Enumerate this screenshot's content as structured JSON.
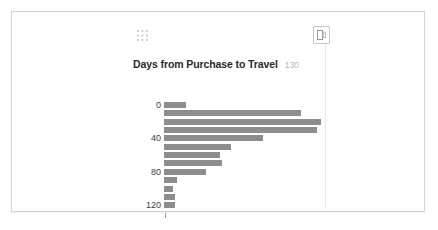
{
  "card": {
    "name": "dashboard-card"
  },
  "toolbar": {
    "drag_handle_icon": "grid-drag-handle-icon",
    "export_icon": "export-icon",
    "export_title": "Export"
  },
  "chart_data": {
    "type": "bar",
    "orientation": "horizontal",
    "title": "Days from Purchase to Travel",
    "count_badge": "130",
    "xlabel": "",
    "ylabel": "",
    "categories": [
      "0",
      "10",
      "20",
      "30",
      "40",
      "50",
      "60",
      "70",
      "80",
      "90",
      "100",
      "110",
      "120"
    ],
    "values": [
      17,
      108,
      124,
      121,
      78,
      53,
      44,
      46,
      33,
      10,
      7,
      9,
      9
    ],
    "bar_color": "#8d8d8d",
    "axis_tick_labels": [
      "0",
      "40",
      "80",
      "120"
    ],
    "axis_tick_positions": [
      0,
      40,
      80,
      120
    ],
    "ylim": [
      0,
      130
    ],
    "xlim": [
      0,
      130
    ],
    "grid": false,
    "legend": false
  }
}
